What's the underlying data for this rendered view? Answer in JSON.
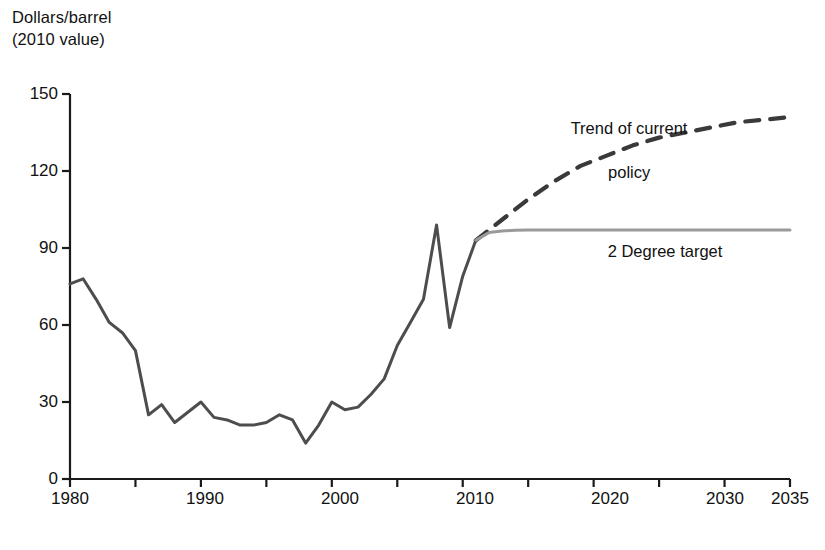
{
  "chart_data": {
    "type": "line",
    "title": "",
    "subtitle": "",
    "ylabel_line1": "Dollars/barrel",
    "ylabel_line2": "(2010 value)",
    "xlabel": "",
    "xlim": [
      1980,
      2035
    ],
    "ylim": [
      0,
      150
    ],
    "grid": false,
    "legend_position": "inline-annotations",
    "y_ticks": [
      "0",
      "30",
      "60",
      "90",
      "120",
      "150"
    ],
    "y_tick_values": [
      0,
      30,
      60,
      90,
      120,
      150
    ],
    "x_ticks": [
      "1980",
      "1990",
      "2000",
      "2010",
      "2020",
      "2030",
      "2035"
    ],
    "x_tick_values": [
      1980,
      1990,
      2000,
      2010,
      2020,
      2030,
      2035
    ],
    "x_minor_tick_values": [
      1985,
      1995,
      2005,
      2015,
      2025
    ],
    "annotations": [
      {
        "name": "trend-of-current-policy",
        "text_line1": "Trend of current",
        "text_line2": "policy",
        "x": 620,
        "y": 104
      },
      {
        "name": "two-degree-target",
        "text": "2 Degree target",
        "x": 665,
        "y": 255
      }
    ],
    "series": [
      {
        "name": "Historical oil price",
        "style": "solid",
        "color": "#4d4d4d",
        "x": [
          1980,
          1981,
          1982,
          1983,
          1984,
          1985,
          1986,
          1987,
          1988,
          1989,
          1990,
          1991,
          1992,
          1993,
          1994,
          1995,
          1996,
          1997,
          1998,
          1999,
          2000,
          2001,
          2002,
          2003,
          2004,
          2005,
          2006,
          2007,
          2008,
          2009,
          2010,
          2011
        ],
        "values": [
          76,
          78,
          70,
          61,
          57,
          50,
          25,
          29,
          22,
          26,
          30,
          24,
          23,
          21,
          21,
          22,
          25,
          23,
          14,
          21,
          30,
          27,
          28,
          33,
          39,
          52,
          61,
          70,
          99,
          59,
          79,
          93
        ]
      },
      {
        "name": "Trend of current policy",
        "style": "dashed",
        "color": "#3a3a3a",
        "x": [
          2011,
          2013,
          2015,
          2017,
          2019,
          2021,
          2023,
          2025,
          2027,
          2029,
          2031,
          2033,
          2035
        ],
        "values": [
          93,
          101,
          109,
          116,
          122,
          126,
          130,
          133,
          135,
          137,
          139,
          140,
          141
        ]
      },
      {
        "name": "2 Degree target",
        "style": "solid",
        "color": "#9a9a9a",
        "x": [
          2011,
          2012,
          2013,
          2014,
          2015,
          2017,
          2020,
          2025,
          2030,
          2035
        ],
        "values": [
          93,
          96,
          96.6,
          96.9,
          97,
          97,
          97,
          97,
          97,
          97
        ]
      }
    ]
  },
  "plot": {
    "left_px": 70,
    "right_px": 790,
    "top_px": 94,
    "bottom_px": 479,
    "axis_color": "#1a1a1a"
  }
}
